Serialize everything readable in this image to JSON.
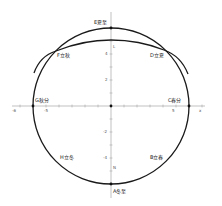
{
  "diagram": {
    "type": "coordinate-circle-solar-terms",
    "axes": {
      "x_label": "x",
      "x_left_label": "-6",
      "x_ticks": [
        {
          "label": "-5",
          "x": -5
        },
        {
          "label": "5",
          "x": 5
        }
      ],
      "y_ticks": [
        {
          "label": "4",
          "y": 4
        },
        {
          "label": "2",
          "y": 2
        },
        {
          "label": "-2",
          "y": -2
        },
        {
          "label": "-4",
          "y": -4
        }
      ],
      "y_markers": [
        {
          "label": "L",
          "y": 5
        },
        {
          "label": "N",
          "y": -5
        }
      ]
    },
    "points": [
      {
        "id": "E",
        "label": "E夏至",
        "position": "top"
      },
      {
        "id": "F",
        "label": "F立秋",
        "position": "upper-left"
      },
      {
        "id": "D",
        "label": "D立夏",
        "position": "upper-right"
      },
      {
        "id": "G",
        "label": "G秋分",
        "position": "left"
      },
      {
        "id": "C",
        "label": "C春分",
        "position": "right"
      },
      {
        "id": "H",
        "label": "H立冬",
        "position": "lower-left"
      },
      {
        "id": "B",
        "label": "B立春",
        "position": "lower-right"
      },
      {
        "id": "A",
        "label": "A冬至",
        "position": "bottom"
      }
    ],
    "curves": [
      {
        "name": "circle",
        "description": "circle centered at origin"
      },
      {
        "name": "arc",
        "description": "flattened arc through F, L, D"
      }
    ],
    "colors": {
      "line": "#1a1a1a",
      "axis": "#999999",
      "text": "#222222"
    }
  }
}
